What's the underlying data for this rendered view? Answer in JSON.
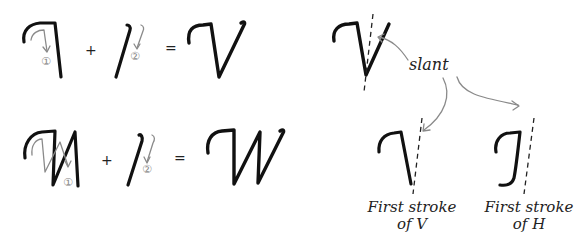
{
  "diagram": {
    "row1": {
      "stroke1_number": "①",
      "plus": "+",
      "stroke2_number": "②",
      "equals": "=",
      "result_letter": "V"
    },
    "row2": {
      "stroke1_number": "①",
      "plus": "+",
      "stroke2_number": "②",
      "equals": "=",
      "result_letter": "W"
    },
    "annotations": {
      "slant_label": "slant",
      "caption_left_line1": "First stroke",
      "caption_left_line2": "of V",
      "caption_right_line1": "First stroke",
      "caption_right_line2": "of H"
    },
    "colors": {
      "ink": "#111111",
      "guide": "#8a8a8a",
      "background": "#ffffff"
    }
  }
}
